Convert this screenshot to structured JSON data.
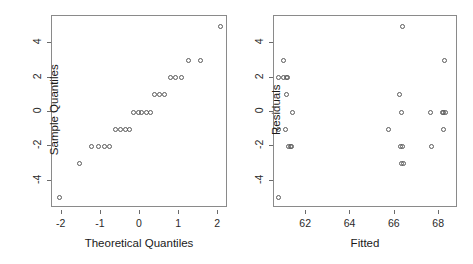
{
  "figure": {
    "background_color": "#ffffff",
    "axis_color": "#8a8a8a",
    "point_color": "#5a5a5a",
    "text_color": "#1a1a1a",
    "panel_count": 2
  },
  "chart_data": [
    {
      "type": "scatter",
      "id": "qq-plot",
      "title": "",
      "xlabel": "Theoretical Quantiles",
      "ylabel": "Sample Quantiles",
      "xlim": [
        -2.25,
        2.25
      ],
      "ylim": [
        -5.6,
        5.6
      ],
      "xticks": [
        -2,
        -1,
        0,
        1,
        2
      ],
      "xticklabels": [
        "-2",
        "-1",
        "0",
        "1",
        "2"
      ],
      "yticks": [
        -4,
        -2,
        0,
        2,
        4
      ],
      "yticklabels": [
        "-4",
        "-2",
        "0",
        "2",
        "4"
      ],
      "grid": false,
      "legend": false,
      "marker": "open-circle",
      "x": [
        -2.05,
        -1.55,
        -1.25,
        -1.06,
        -0.92,
        -0.79,
        -0.63,
        -0.5,
        -0.38,
        -0.27,
        -0.16,
        -0.05,
        0.05,
        0.16,
        0.27,
        0.38,
        0.5,
        0.63,
        0.79,
        0.92,
        1.06,
        1.25,
        1.55,
        2.05
      ],
      "y": [
        -5,
        -3,
        -2,
        -2,
        -2,
        -2,
        -1,
        -1,
        -1,
        -1,
        0,
        0,
        0,
        0,
        0,
        1,
        1,
        1,
        2,
        2,
        2,
        3,
        3,
        5
      ],
      "n_points": 24
    },
    {
      "type": "scatter",
      "id": "residuals-vs-fitted",
      "title": "",
      "xlabel": "Fitted",
      "ylabel": "Residuals",
      "xlim": [
        60.55,
        68.85
      ],
      "ylim": [
        -5.6,
        5.6
      ],
      "xticks": [
        62,
        64,
        66,
        68
      ],
      "xticklabels": [
        "62",
        "64",
        "66",
        "68"
      ],
      "yticks": [
        -4,
        -2,
        0,
        2,
        4
      ],
      "yticklabels": [
        "-4",
        "-2",
        "0",
        "2",
        "4"
      ],
      "grid": false,
      "legend": false,
      "marker": "open-circle",
      "x": [
        60.75,
        60.75,
        60.75,
        61.0,
        61.0,
        61.1,
        61.15,
        61.1,
        61.05,
        61.2,
        61.4,
        61.3,
        61.35,
        66.35,
        66.2,
        66.3,
        66.35,
        66.4,
        65.7,
        66.25,
        68.25,
        68.15,
        68.3,
        67.6,
        68.2,
        68.2,
        67.65,
        66.3
      ],
      "y": [
        2,
        -1,
        -5,
        3,
        2,
        2,
        2,
        1,
        -1,
        -2,
        0,
        -2,
        -2,
        5,
        1,
        0,
        -2,
        -3,
        -1,
        -2,
        3,
        0,
        0,
        0,
        0,
        -1,
        -2,
        -3
      ],
      "n_points": 28
    }
  ]
}
